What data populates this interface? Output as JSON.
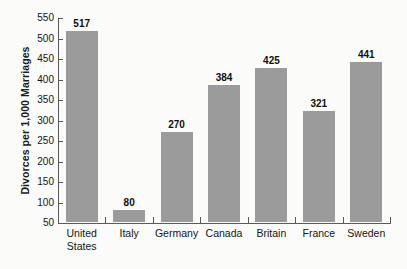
{
  "chart_data": {
    "type": "bar",
    "title": "",
    "xlabel": "",
    "ylabel": "Divorces per 1,000 Marriages",
    "ylim": [
      50,
      550
    ],
    "ytick_step": 50,
    "yticks": [
      550,
      500,
      450,
      400,
      350,
      300,
      250,
      200,
      150,
      100,
      50
    ],
    "grid": false,
    "legend": false,
    "bar_color": "#9b9b9b",
    "categories": [
      "United States",
      "Italy",
      "Germany",
      "Canada",
      "Britain",
      "France",
      "Sweden"
    ],
    "values": [
      517,
      80,
      270,
      384,
      425,
      321,
      441
    ],
    "data_labels": [
      "517",
      "80",
      "270",
      "384",
      "425",
      "321",
      "441"
    ]
  },
  "axis": {
    "y_title": "Divorces per 1,000 Marriages",
    "y_tick_labels": [
      "550",
      "500",
      "450",
      "400",
      "350",
      "300",
      "250",
      "200",
      "150",
      "100",
      "50"
    ],
    "x_tick_labels": [
      "United States",
      "Italy",
      "Germany",
      "Canada",
      "Britain",
      "France",
      "Sweden"
    ]
  }
}
